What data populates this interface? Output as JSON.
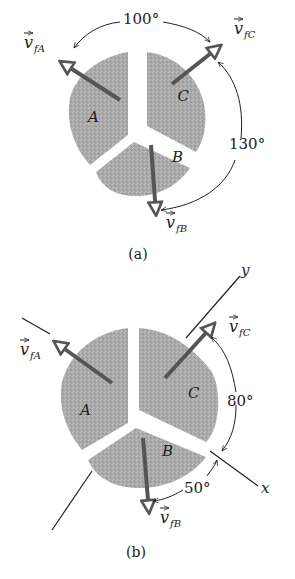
{
  "figure_a": {
    "caption": "(a)",
    "pieces": [
      {
        "id": "A",
        "label": "A"
      },
      {
        "id": "B",
        "label": "B"
      },
      {
        "id": "C",
        "label": "C"
      }
    ],
    "vectors": {
      "A": {
        "symbol": "v",
        "subscript": "fA"
      },
      "B": {
        "symbol": "v",
        "subscript": "fB"
      },
      "C": {
        "symbol": "v",
        "subscript": "fC"
      }
    },
    "angles": {
      "A_to_C": "100°",
      "C_to_B": "130°"
    }
  },
  "figure_b": {
    "caption": "(b)",
    "pieces": [
      {
        "id": "A",
        "label": "A"
      },
      {
        "id": "B",
        "label": "B"
      },
      {
        "id": "C",
        "label": "C"
      }
    ],
    "vectors": {
      "A": {
        "symbol": "v",
        "subscript": "fA"
      },
      "B": {
        "symbol": "v",
        "subscript": "fB"
      },
      "C": {
        "symbol": "v",
        "subscript": "fC"
      }
    },
    "axes": {
      "x": "x",
      "y": "y"
    },
    "angles": {
      "C_to_x": "80°",
      "x_to_B": "50°"
    }
  },
  "colors": {
    "piece_fill": "#a9a9a9",
    "vector": "#555555",
    "line": "#222222",
    "background": "#ffffff"
  }
}
